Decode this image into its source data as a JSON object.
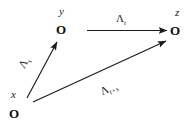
{
  "diagram": {
    "type": "commutative-diagram",
    "background_color": "#ffffff",
    "stroke_color": "#1b1b1b",
    "nodes": [
      {
        "id": "x",
        "label": "x",
        "marker": "O",
        "x": 14,
        "y": 113
      },
      {
        "id": "y",
        "label": "y",
        "marker": "O",
        "x": 61,
        "y": 30
      },
      {
        "id": "z",
        "label": "z",
        "marker": "O",
        "x": 176,
        "y": 31
      }
    ],
    "edges": [
      {
        "id": "x-to-y",
        "from": "x",
        "to": "y",
        "label_lambda": "Λ",
        "label_sub": "s",
        "label_full": "Λₛ"
      },
      {
        "id": "y-to-z",
        "from": "y",
        "to": "z",
        "label_lambda": "Λ",
        "label_sub": "t",
        "label_full": "Λₜ"
      },
      {
        "id": "x-to-z",
        "from": "x",
        "to": "z",
        "label_lambda": "Λ",
        "label_sub": "t+s",
        "label_full": "Λₜ₊ₛ"
      }
    ]
  }
}
